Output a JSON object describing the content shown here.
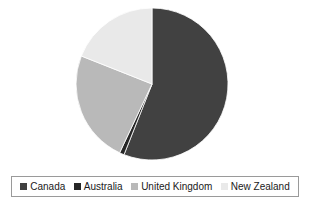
{
  "chart_data": {
    "type": "pie",
    "title": "",
    "categories": [
      "Canada",
      "Australia",
      "United Kingdom",
      "New Zealand"
    ],
    "values": [
      56,
      1,
      24,
      19
    ],
    "unit": "percent",
    "start_angle_deg": 0,
    "direction": "clockwise",
    "legend_position": "bottom",
    "grid": false,
    "slices": [
      {
        "label": "Canada",
        "value": 56,
        "color": "#414141",
        "start_deg": 0,
        "end_deg": 201.6
      },
      {
        "label": "Australia",
        "value": 1,
        "color": "#262626",
        "start_deg": 201.6,
        "end_deg": 205.2
      },
      {
        "label": "United Kingdom",
        "value": 24,
        "color": "#b9b9b9",
        "start_deg": 205.2,
        "end_deg": 291.6
      },
      {
        "label": "New Zealand",
        "value": 19,
        "color": "#e9e9e9",
        "start_deg": 291.6,
        "end_deg": 360
      }
    ]
  },
  "legend": {
    "items": [
      {
        "label": "Canada",
        "color": "#414141"
      },
      {
        "label": "Australia",
        "color": "#262626"
      },
      {
        "label": "United Kingdom",
        "color": "#b9b9b9"
      },
      {
        "label": "New Zealand",
        "color": "#e9e9e9"
      }
    ],
    "border_color": "#9a9a9a"
  },
  "geometry": {
    "center_x": 152,
    "center_y": 84,
    "radius": 76
  }
}
